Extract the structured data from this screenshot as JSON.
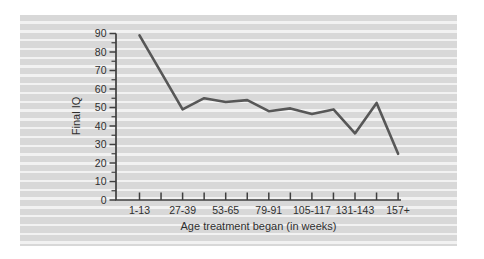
{
  "figure": {
    "kind": "scanned textbook line-graph figure on striped shaded panel"
  },
  "colors": {
    "page_bg": "#ffffff",
    "stripe_dark": "#d8d8d8",
    "stripe_light": "#f2f2f2",
    "line": "#575757",
    "axis": "#3f3f3f",
    "text": "#2f2f2f"
  },
  "chart_data": {
    "type": "line",
    "title": "",
    "xlabel": "Age treatment began (in weeks)",
    "ylabel": "Final IQ",
    "x_tick_labels": [
      "1-13",
      "",
      "27-39",
      "",
      "53-65",
      "",
      "79-91",
      "",
      "105-117",
      "",
      "131-143",
      "",
      "157+"
    ],
    "values": [
      89,
      69,
      49,
      55,
      53,
      54,
      48,
      49.5,
      46.5,
      49,
      36,
      52.5,
      25
    ],
    "y_ticks": [
      0,
      10,
      20,
      30,
      40,
      50,
      60,
      70,
      80,
      90
    ],
    "ylim": [
      0,
      90
    ],
    "y_minor_tick_step": 5,
    "grid": "off",
    "legend": "none",
    "marker": "none"
  }
}
